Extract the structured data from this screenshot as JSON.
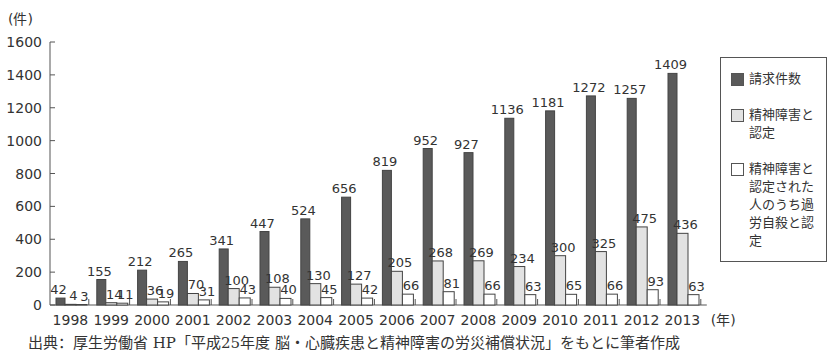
{
  "chart_data": {
    "type": "bar",
    "title": "",
    "xlabel": "(年)",
    "ylabel": "(件)",
    "ylim": [
      0,
      1600
    ],
    "yticks": [
      0,
      200,
      400,
      600,
      800,
      1000,
      1200,
      1400,
      1600
    ],
    "grid": false,
    "legend_position": "right",
    "categories": [
      "1998",
      "1999",
      "2000",
      "2001",
      "2002",
      "2003",
      "2004",
      "2005",
      "2006",
      "2007",
      "2008",
      "2009",
      "2010",
      "2011",
      "2012",
      "2013"
    ],
    "series": [
      {
        "name": "請求件数",
        "color": "#5a5a5a",
        "values": [
          42,
          155,
          212,
          265,
          341,
          447,
          524,
          656,
          819,
          952,
          927,
          1136,
          1181,
          1272,
          1257,
          1409
        ]
      },
      {
        "name": "精神障害と認定",
        "color": "#e2e2e2",
        "values": [
          4,
          14,
          36,
          70,
          100,
          108,
          130,
          127,
          205,
          268,
          269,
          234,
          300,
          325,
          475,
          436
        ]
      },
      {
        "name": "精神障害と認定された人のうち過労自殺と認定",
        "color": "#ffffff",
        "values": [
          3,
          11,
          19,
          31,
          43,
          40,
          45,
          42,
          66,
          81,
          66,
          63,
          65,
          66,
          93,
          63
        ]
      }
    ]
  },
  "axis": {
    "y_unit": "(件)",
    "x_unit": "(年)"
  },
  "legend": {
    "items": [
      {
        "label": "請求件数",
        "color": "#5a5a5a"
      },
      {
        "label": "精神障害と認定",
        "color": "#e2e2e2"
      },
      {
        "label": "精神障害と認定された人のうち過労自殺と認定",
        "color": "#ffffff"
      }
    ]
  },
  "caption": "出典：厚生労働省 HP「平成25年度 脳・心臓疾患と精神障害の労災補償状況」をもとに筆者作成"
}
